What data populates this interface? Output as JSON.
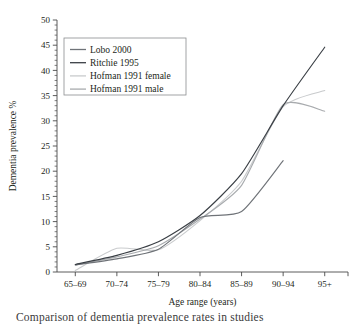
{
  "chart_data": {
    "type": "line",
    "title": "",
    "xlabel": "Age range (years)",
    "ylabel": "Dementia prevalence %",
    "categories": [
      "65–69",
      "70–74",
      "75–79",
      "80–84",
      "85–89",
      "90–94",
      "95+"
    ],
    "ylim": [
      0,
      50
    ],
    "ytick_values": [
      0,
      5,
      10,
      15,
      20,
      25,
      30,
      35,
      40,
      45,
      50
    ],
    "ytick_labels": [
      "0",
      "5",
      "10",
      "15",
      "20",
      "25",
      "30",
      "35",
      "40",
      "45",
      "50"
    ],
    "y_minor_tick_step": 1,
    "grid": false,
    "legend_position": "upper-left",
    "smoothing": "spline",
    "series": [
      {
        "name": "Lobo 2000",
        "color": "#6f7378",
        "values": [
          1.4,
          2.6,
          4.5,
          10.8,
          12.0,
          22.1,
          null
        ]
      },
      {
        "name": "Ritchie 1995",
        "color": "#3a3f45",
        "values": [
          1.5,
          3.3,
          6.0,
          11.2,
          19.5,
          33.0,
          44.6
        ]
      },
      {
        "name": "Hofman 1991 female",
        "color": "#c9cbcd",
        "values": [
          0.3,
          4.7,
          4.4,
          10.2,
          18.0,
          32.8,
          36.0
        ]
      },
      {
        "name": "Hofman 1991 male",
        "color": "#a8abae",
        "values": [
          1.4,
          3.0,
          5.2,
          10.5,
          17.2,
          33.2,
          31.9
        ]
      }
    ]
  },
  "legend": {
    "entries": [
      {
        "label": "Lobo 2000"
      },
      {
        "label": "Ritchie 1995"
      },
      {
        "label": "Hofman 1991 female"
      },
      {
        "label": "Hofman 1991 male"
      }
    ]
  },
  "axes": {
    "y_title": "Dementia prevalence %",
    "x_title": "Age range (years)"
  },
  "caption": {
    "clipped_text": "Comparison of dementia prevalence rates in studies"
  },
  "colors": {
    "axis": "#4a4a4a",
    "text": "#231f20",
    "background": "#ffffff",
    "legend_border": "#8b8d8f"
  }
}
